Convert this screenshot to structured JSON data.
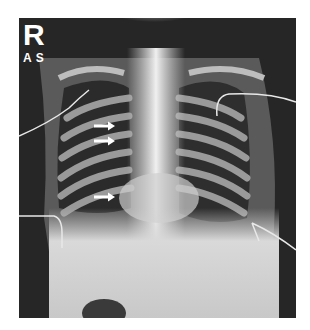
{
  "image": {
    "description": "Frontal chest radiograph of an infant with white arrows indicating findings in the right hemithorax",
    "orientation_marker": "R",
    "position_marker": "AS",
    "arrow_count": 3,
    "colors": {
      "background": "#ffffff",
      "film_dark": "#1c1c1c",
      "bone": "#d8d8d8",
      "soft_tissue": "#bdbdbd",
      "arrow": "#ffffff"
    }
  }
}
